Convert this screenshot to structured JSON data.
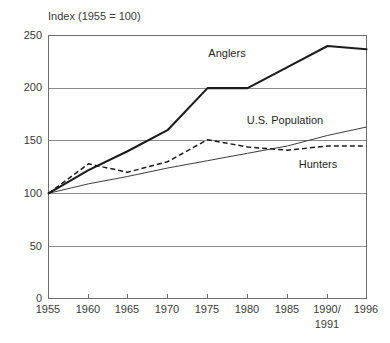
{
  "chart_data": {
    "type": "line",
    "title": "Index (1955 = 100)",
    "xlabel": "",
    "ylabel": "",
    "xlim": [
      1955,
      1996
    ],
    "ylim": [
      0,
      250
    ],
    "grid": true,
    "grid_axis": "y",
    "legend": "inline-annotations",
    "x": [
      1955,
      1960,
      1965,
      1970,
      1975,
      1980,
      1985,
      1991,
      1996
    ],
    "categories": [
      "1955",
      "1960",
      "1965",
      "1970",
      "1975",
      "1980",
      "1985",
      "1990/\n1991",
      "1996"
    ],
    "yticks": [
      0,
      50,
      100,
      150,
      200,
      250
    ],
    "ytick_labels": [
      "0",
      "50",
      "100",
      "150",
      "200",
      "250"
    ],
    "series": [
      {
        "name": "Anglers",
        "style": "solid-thick",
        "values": [
          100,
          122,
          140,
          160,
          200,
          200,
          220,
          240,
          237
        ]
      },
      {
        "name": "U.S. Population",
        "style": "solid-thin",
        "values": [
          100,
          109,
          116,
          124,
          131,
          138,
          145,
          155,
          163
        ]
      },
      {
        "name": "Hunters",
        "style": "dashed",
        "values": [
          100,
          128,
          120,
          130,
          151,
          144,
          141,
          145,
          145
        ]
      }
    ],
    "annotations": [
      {
        "text": "Anglers",
        "x": 1977,
        "y": 222
      },
      {
        "text": "U.S. Population",
        "x": 1981,
        "y": 163
      },
      {
        "text": "Hunters",
        "x": 1987,
        "y": 127
      }
    ]
  },
  "axis": {
    "ytick_0": "0",
    "ytick_50": "50",
    "ytick_100": "100",
    "ytick_150": "150",
    "ytick_200": "200",
    "ytick_250": "250",
    "xtick_1955": "1955",
    "xtick_1960": "1960",
    "xtick_1965": "1965",
    "xtick_1970": "1970",
    "xtick_1975": "1975",
    "xtick_1980": "1980",
    "xtick_1985": "1985",
    "xtick_1990a": "1990/",
    "xtick_1990b": "1991",
    "xtick_1996": "1996"
  },
  "labels": {
    "title": "Index (1955 = 100)",
    "anglers": "Anglers",
    "population": "U.S. Population",
    "hunters": "Hunters"
  },
  "colors": {
    "anglers": "#1c1c1c",
    "population": "#3d3d3d",
    "hunters": "#1c1c1c",
    "grid": "#8a8a8a",
    "frame": "#6f6f6f",
    "background": "#ffffff"
  }
}
